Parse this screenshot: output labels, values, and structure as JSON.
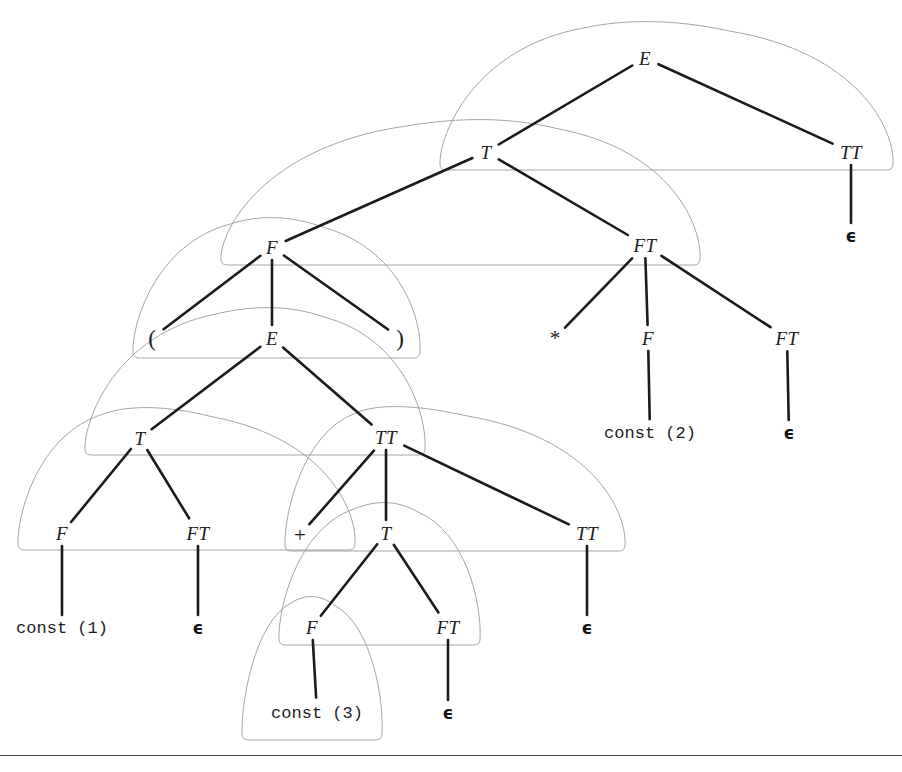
{
  "figure": {
    "kind": "parse-tree",
    "background_color": "#ffffff",
    "edge_color": "#1b1b1b",
    "blob_color": "#9a9a9a",
    "rule_color": "#4a4a4a",
    "rule_y": 755
  },
  "nodes": [
    {
      "id": "E0",
      "label": "E",
      "kind": "nonterminal",
      "x": 645,
      "y": 58,
      "style": "nt"
    },
    {
      "id": "T0",
      "label": "T",
      "kind": "nonterminal",
      "x": 486,
      "y": 152,
      "style": "nt"
    },
    {
      "id": "TT0",
      "label": "TT",
      "kind": "nonterminal",
      "x": 851,
      "y": 152,
      "style": "nt"
    },
    {
      "id": "eps0",
      "label": "ϵ",
      "kind": "terminal",
      "x": 851,
      "y": 236,
      "style": "term-eps"
    },
    {
      "id": "F0",
      "label": "F",
      "kind": "nonterminal",
      "x": 272,
      "y": 247,
      "style": "nt"
    },
    {
      "id": "FT0",
      "label": "FT",
      "kind": "nonterminal",
      "x": 645,
      "y": 245,
      "style": "nt"
    },
    {
      "id": "lparen",
      "label": "(",
      "kind": "terminal",
      "x": 152,
      "y": 338,
      "style": "paren"
    },
    {
      "id": "E1",
      "label": "E",
      "kind": "nonterminal",
      "x": 272,
      "y": 338,
      "style": "nt"
    },
    {
      "id": "rparen",
      "label": ")",
      "kind": "terminal",
      "x": 400,
      "y": 338,
      "style": "paren"
    },
    {
      "id": "star",
      "label": "*",
      "kind": "terminal",
      "x": 555,
      "y": 338,
      "style": "term-sym"
    },
    {
      "id": "F1",
      "label": "F",
      "kind": "nonterminal",
      "x": 648,
      "y": 338,
      "style": "nt"
    },
    {
      "id": "FT1",
      "label": "FT",
      "kind": "nonterminal",
      "x": 787,
      "y": 338,
      "style": "nt"
    },
    {
      "id": "const2",
      "label": "const (2)",
      "kind": "terminal",
      "x": 650,
      "y": 433,
      "style": "term-mono"
    },
    {
      "id": "eps1",
      "label": "ϵ",
      "kind": "terminal",
      "x": 789,
      "y": 433,
      "style": "term-eps"
    },
    {
      "id": "T1",
      "label": "T",
      "kind": "nonterminal",
      "x": 140,
      "y": 438,
      "style": "nt"
    },
    {
      "id": "TT1",
      "label": "TT",
      "kind": "nonterminal",
      "x": 386,
      "y": 437,
      "style": "nt"
    },
    {
      "id": "F2",
      "label": "F",
      "kind": "nonterminal",
      "x": 62,
      "y": 533,
      "style": "nt"
    },
    {
      "id": "FT2",
      "label": "FT",
      "kind": "nonterminal",
      "x": 198,
      "y": 533,
      "style": "nt"
    },
    {
      "id": "plus",
      "label": "+",
      "kind": "terminal",
      "x": 300,
      "y": 535,
      "style": "term-sym"
    },
    {
      "id": "T2",
      "label": "T",
      "kind": "nonterminal",
      "x": 386,
      "y": 533,
      "style": "nt"
    },
    {
      "id": "TT2",
      "label": "TT",
      "kind": "nonterminal",
      "x": 587,
      "y": 533,
      "style": "nt"
    },
    {
      "id": "const1",
      "label": "const (1)",
      "kind": "terminal",
      "x": 62,
      "y": 628,
      "style": "term-mono"
    },
    {
      "id": "eps2",
      "label": "ϵ",
      "kind": "terminal",
      "x": 198,
      "y": 628,
      "style": "term-eps"
    },
    {
      "id": "F3",
      "label": "F",
      "kind": "nonterminal",
      "x": 312,
      "y": 627,
      "style": "nt"
    },
    {
      "id": "FT3",
      "label": "FT",
      "kind": "nonterminal",
      "x": 448,
      "y": 627,
      "style": "nt"
    },
    {
      "id": "eps3",
      "label": "ϵ",
      "kind": "terminal",
      "x": 587,
      "y": 628,
      "style": "term-eps"
    },
    {
      "id": "const3",
      "label": "const (3)",
      "kind": "terminal",
      "x": 317,
      "y": 713,
      "style": "term-mono"
    },
    {
      "id": "eps4",
      "label": "ϵ",
      "kind": "terminal",
      "x": 448,
      "y": 713,
      "style": "term-eps"
    }
  ],
  "edges": [
    {
      "from": "E0",
      "to": "T0"
    },
    {
      "from": "E0",
      "to": "TT0"
    },
    {
      "from": "TT0",
      "to": "eps0"
    },
    {
      "from": "T0",
      "to": "F0"
    },
    {
      "from": "T0",
      "to": "FT0"
    },
    {
      "from": "F0",
      "to": "lparen"
    },
    {
      "from": "F0",
      "to": "E1"
    },
    {
      "from": "F0",
      "to": "rparen"
    },
    {
      "from": "FT0",
      "to": "star"
    },
    {
      "from": "FT0",
      "to": "F1"
    },
    {
      "from": "FT0",
      "to": "FT1"
    },
    {
      "from": "F1",
      "to": "const2"
    },
    {
      "from": "FT1",
      "to": "eps1"
    },
    {
      "from": "E1",
      "to": "T1"
    },
    {
      "from": "E1",
      "to": "TT1"
    },
    {
      "from": "T1",
      "to": "F2"
    },
    {
      "from": "T1",
      "to": "FT2"
    },
    {
      "from": "TT1",
      "to": "plus"
    },
    {
      "from": "TT1",
      "to": "T2"
    },
    {
      "from": "TT1",
      "to": "TT2"
    },
    {
      "from": "F2",
      "to": "const1"
    },
    {
      "from": "FT2",
      "to": "eps2"
    },
    {
      "from": "T2",
      "to": "F3"
    },
    {
      "from": "T2",
      "to": "FT3"
    },
    {
      "from": "TT2",
      "to": "eps3"
    },
    {
      "from": "F3",
      "to": "const3"
    },
    {
      "from": "FT3",
      "to": "eps4"
    }
  ],
  "subtree_outlines": [
    {
      "name": "outline-E0",
      "root": "E0",
      "left": 440,
      "right": 893,
      "top": 22,
      "bottom": 170
    },
    {
      "name": "outline-T0",
      "root": "T0",
      "left": 221,
      "right": 700,
      "top": 120,
      "bottom": 265
    },
    {
      "name": "outline-F0",
      "root": "F0",
      "left": 133,
      "right": 420,
      "top": 218,
      "bottom": 358
    },
    {
      "name": "outline-E1",
      "root": "E1",
      "left": 85,
      "right": 425,
      "top": 308,
      "bottom": 455
    },
    {
      "name": "outline-T1",
      "root": "T1",
      "left": 18,
      "right": 355,
      "top": 408,
      "bottom": 550
    },
    {
      "name": "outline-TT1",
      "root": "TT1",
      "left": 285,
      "right": 625,
      "top": 407,
      "bottom": 551
    },
    {
      "name": "outline-T2",
      "root": "T2",
      "left": 279,
      "right": 480,
      "top": 503,
      "bottom": 645
    },
    {
      "name": "outline-F3",
      "root": "F3",
      "left": 242,
      "right": 382,
      "top": 597,
      "bottom": 740
    }
  ],
  "grammar_note": {
    "productions": [
      "E  -> T TT",
      "TT -> + T TT | ϵ",
      "T  -> F FT",
      "FT -> * F FT | ϵ",
      "F  -> ( E ) | const"
    ]
  }
}
